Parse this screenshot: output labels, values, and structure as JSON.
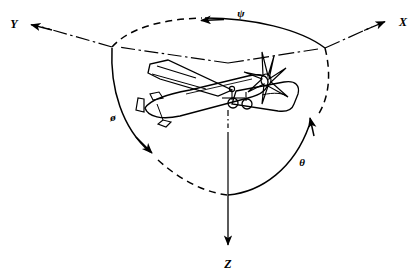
{
  "figure": {
    "background_color": "#ffffff",
    "line_color": "#000000",
    "width": 418,
    "height": 277
  },
  "axes": [
    {
      "key": "y",
      "label": "Y",
      "name": "y-axis",
      "style": "dash-dot",
      "direction": "up-left",
      "label_x": 14,
      "label_y": 28,
      "arrow_tip": [
        30,
        25
      ],
      "origin": [
        228,
        63
      ]
    },
    {
      "key": "x",
      "label": "X",
      "name": "x-axis",
      "style": "dash-dot",
      "direction": "up-right",
      "label_x": 403,
      "label_y": 26,
      "arrow_tip": [
        386,
        22
      ],
      "origin": [
        228,
        63
      ]
    },
    {
      "key": "z",
      "label": "Z",
      "name": "z-axis",
      "style": "solid",
      "direction": "down",
      "label_x": 228,
      "label_y": 266,
      "arrow_tip": [
        228,
        247
      ],
      "origin": [
        228,
        63
      ]
    }
  ],
  "angles": [
    {
      "key": "psi",
      "label": "ψ",
      "name": "yaw-angle-psi",
      "axis": "Z",
      "motion": "yaw",
      "label_x": 241,
      "label_y": 17,
      "arc_style": "dashed-left-solid-right",
      "arrow_direction": "left",
      "arrow_tip": [
        200,
        26
      ]
    },
    {
      "key": "phi",
      "label": "ø",
      "name": "roll-angle-phi",
      "axis": "X",
      "motion": "roll",
      "label_x": 113,
      "label_y": 121,
      "arc_style": "solid-upper-dashed-lower",
      "arrow_direction": "down",
      "arrow_tip": [
        152,
        155
      ]
    },
    {
      "key": "theta",
      "label": "θ",
      "name": "pitch-angle-theta",
      "axis": "Y",
      "motion": "pitch",
      "label_x": 302,
      "label_y": 166,
      "arc_style": "solid-lower-dashed-upper",
      "arrow_direction": "up",
      "arrow_tip": [
        311,
        116
      ]
    }
  ],
  "aircraft": {
    "name": "airplane-illustration",
    "description": "single-engine propeller monoplane in three-quarter view",
    "center": [
      235,
      102
    ],
    "parts": [
      "fuselage",
      "propeller",
      "left-wing",
      "right-wing",
      "vertical-stabilizer",
      "horizontal-stabilizer",
      "main-landing-gear",
      "nose-gear"
    ]
  },
  "junctions": {
    "left_vertex": [
      112,
      48
    ],
    "right_vertex": [
      325,
      48
    ],
    "bottom_vertex": [
      228,
      195
    ],
    "origin": [
      228,
      63
    ]
  }
}
